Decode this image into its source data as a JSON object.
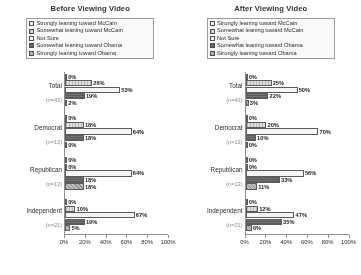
{
  "legend_labels": [
    "Strongly leaning toward McCain",
    "Somewhat leaning toward McCain",
    "Not Sure",
    "Somewhat leaning toward Obama",
    "Strongly leaning toward Obama"
  ],
  "axis": {
    "ticks": [
      "0%",
      "20%",
      "40%",
      "60%",
      "80%",
      "100%"
    ],
    "tick_values": [
      0,
      20,
      40,
      60,
      80,
      100
    ]
  },
  "groups": [
    {
      "label": "Total",
      "n": "(n=43)"
    },
    {
      "label": "Democrat",
      "n": "(n=13)"
    },
    {
      "label": "Republican",
      "n": "(n=13)"
    },
    {
      "label": "Independent",
      "n": "(n=21)"
    }
  ],
  "panels": [
    {
      "title": "Before Viewing Video",
      "rows": [
        {
          "values": [
            "0%",
            "26%",
            "53%",
            "19%",
            "2%"
          ]
        },
        {
          "values": [
            "0%",
            "18%",
            "64%",
            "18%",
            "0%"
          ]
        },
        {
          "values": [
            "0%",
            "0%",
            "64%",
            "18%",
            "18%"
          ]
        },
        {
          "values": [
            "0%",
            "10%",
            "67%",
            "19%",
            "5%"
          ]
        }
      ]
    },
    {
      "title": "After Viewing Video",
      "rows": [
        {
          "values": [
            "0%",
            "25%",
            "50%",
            "22%",
            "3%"
          ]
        },
        {
          "values": [
            "0%",
            "20%",
            "70%",
            "10%",
            "0%"
          ]
        },
        {
          "values": [
            "0%",
            "0%",
            "56%",
            "33%",
            "11%"
          ]
        },
        {
          "values": [
            "0%",
            "12%",
            "47%",
            "35%",
            "6%"
          ]
        }
      ]
    }
  ],
  "chart_data": {
    "type": "bar",
    "orientation": "horizontal",
    "xlabel": "",
    "ylabel": "",
    "xlim": [
      0,
      100
    ],
    "grid": false,
    "legend_position": "top",
    "categories": [
      "Total (n=43)",
      "Democrat (n=13)",
      "Republican (n=13)",
      "Independent (n=21)"
    ],
    "panels": [
      {
        "title": "Before Viewing Video",
        "series": [
          {
            "name": "Strongly leaning toward McCain",
            "values": [
              0,
              0,
              0,
              0
            ]
          },
          {
            "name": "Somewhat leaning toward McCain",
            "values": [
              26,
              18,
              0,
              10
            ]
          },
          {
            "name": "Not Sure",
            "values": [
              53,
              64,
              64,
              67
            ]
          },
          {
            "name": "Somewhat leaning toward Obama",
            "values": [
              19,
              18,
              18,
              19
            ]
          },
          {
            "name": "Strongly leaning toward Obama",
            "values": [
              2,
              0,
              18,
              5
            ]
          }
        ]
      },
      {
        "title": "After Viewing Video",
        "series": [
          {
            "name": "Strongly leaning toward McCain",
            "values": [
              0,
              0,
              0,
              0
            ]
          },
          {
            "name": "Somewhat leaning toward McCain",
            "values": [
              25,
              20,
              0,
              12
            ]
          },
          {
            "name": "Not Sure",
            "values": [
              50,
              70,
              56,
              47
            ]
          },
          {
            "name": "Somewhat leaning toward Obama",
            "values": [
              22,
              10,
              33,
              35
            ]
          },
          {
            "name": "Strongly leaning toward Obama",
            "values": [
              3,
              0,
              11,
              6
            ]
          }
        ]
      }
    ]
  }
}
